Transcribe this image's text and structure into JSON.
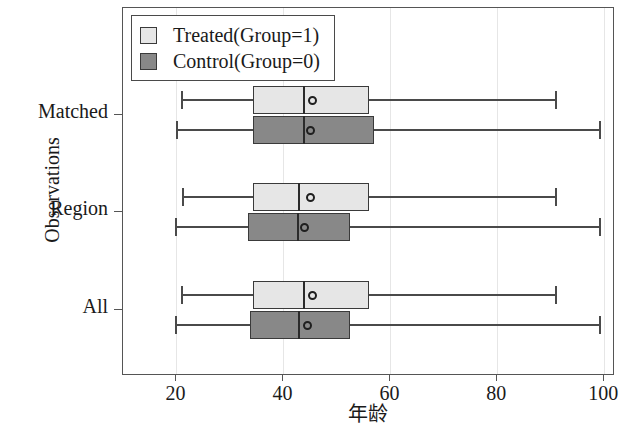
{
  "chart_data": {
    "type": "box",
    "title": "",
    "xlabel": "年龄",
    "ylabel": "Observations",
    "xlim": [
      10,
      102
    ],
    "xticks": [
      20,
      40,
      60,
      80,
      100
    ],
    "xtick_labels": [
      "20",
      "40",
      "60",
      "80",
      "100"
    ],
    "categories": [
      "Matched",
      "Region",
      "All"
    ],
    "grid": "vertical",
    "legend": {
      "position": "top-left",
      "entries": [
        {
          "label": "Treated(Group=1)",
          "color": "#e6e6e6",
          "key": "treated"
        },
        {
          "label": "Control(Group=0)",
          "color": "#888888",
          "key": "control"
        }
      ]
    },
    "series": [
      {
        "name": "Treated(Group=1)",
        "color": "#e6e6e6",
        "boxes": [
          {
            "category": "Matched",
            "min": 20.8,
            "q1": 34.3,
            "median": 43.6,
            "mean": 45.5,
            "q3": 56.0,
            "max": 90.8
          },
          {
            "category": "Region",
            "min": 21.0,
            "q1": 34.3,
            "median": 42.8,
            "mean": 45.0,
            "q3": 56.0,
            "max": 90.8
          },
          {
            "category": "All",
            "min": 20.8,
            "q1": 34.3,
            "median": 43.6,
            "mean": 45.5,
            "q3": 56.0,
            "max": 90.8
          }
        ]
      },
      {
        "name": "Control(Group=0)",
        "color": "#888888",
        "boxes": [
          {
            "category": "Matched",
            "min": 20.0,
            "q1": 34.3,
            "median": 43.6,
            "mean": 45.0,
            "q3": 57.0,
            "max": 99.0
          },
          {
            "category": "Region",
            "min": 19.8,
            "q1": 33.4,
            "median": 42.6,
            "mean": 44.0,
            "q3": 52.5,
            "max": 99.0
          },
          {
            "category": "All",
            "min": 19.8,
            "q1": 33.8,
            "median": 42.8,
            "mean": 44.5,
            "q3": 52.5,
            "max": 99.0
          }
        ]
      }
    ]
  }
}
